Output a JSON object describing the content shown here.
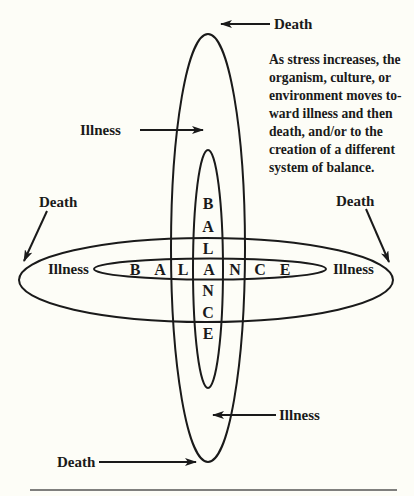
{
  "diagram": {
    "caption_lines": [
      "As stress increases, the",
      "organism, culture, or",
      "environment moves to-",
      "ward illness and then",
      "death, and/or to the",
      "creation of a different",
      "system of balance."
    ],
    "labels": {
      "death_top": "Death",
      "illness_upper_left": "Illness",
      "death_left": "Death",
      "death_right": "Death",
      "illness_left": "Illness",
      "illness_right": "Illness",
      "illness_lower_right": "Illness",
      "death_bottom": "Death"
    },
    "balance_horizontal": [
      "B",
      "A",
      "L",
      "A",
      "N",
      "C",
      "E"
    ],
    "balance_vertical": [
      "B",
      "A",
      "L",
      "A",
      "N",
      "C",
      "E"
    ],
    "colors": {
      "background": "#fdfdf7",
      "ink": "#1a1a1a"
    }
  }
}
